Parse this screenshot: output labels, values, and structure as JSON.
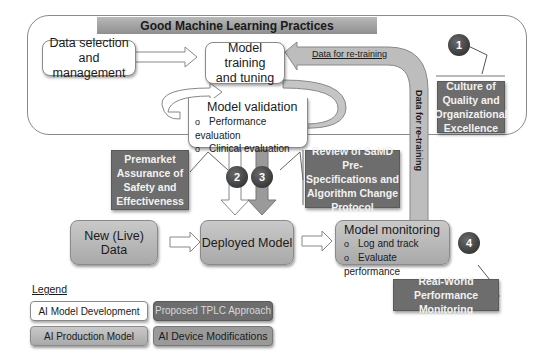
{
  "title": "Good Machine Learning Practices",
  "nodes": {
    "data_selection": "Data selection and management",
    "data_selection_lines": [
      "Data selection and",
      "management"
    ],
    "model_training_lines": [
      "Model training",
      "and tuning"
    ],
    "model_validation": {
      "title": "Model validation",
      "items": [
        "Performance evaluation",
        "Clinical evaluation"
      ]
    },
    "new_live_data": "New (Live) Data",
    "deployed_model": "Deployed Model",
    "model_monitoring": {
      "title": "Model monitoring",
      "items": [
        "Log and track",
        "Evaluate performance"
      ]
    }
  },
  "arrows": {
    "retraining_horizontal": "Data for re-training",
    "retraining_vertical": "Data for re-training"
  },
  "callouts": [
    {
      "number": "1",
      "lines": [
        "Culture of",
        "Quality and",
        "Organizational",
        "Excellence"
      ]
    },
    {
      "number": "2",
      "lines": [
        "Premarket",
        "Assurance of",
        "Safety and",
        "Effectiveness"
      ]
    },
    {
      "number": "3",
      "lines": [
        "Review of SaMD Pre-",
        "Specifications and",
        "Algorithm Change",
        "Protocol"
      ]
    },
    {
      "number": "4",
      "lines": [
        "Real-World Performance",
        "Monitoring"
      ]
    }
  ],
  "legend": {
    "title": "Legend",
    "items": [
      {
        "label": "AI Model Development",
        "color": "#ffffff"
      },
      {
        "label": "Proposed TPLC Approach",
        "color": "#6d6d6d"
      },
      {
        "label": "AI Production Model",
        "color": "#b5b5b5"
      },
      {
        "label": "AI Device Modifications",
        "color": "#9a9a9a"
      }
    ]
  }
}
